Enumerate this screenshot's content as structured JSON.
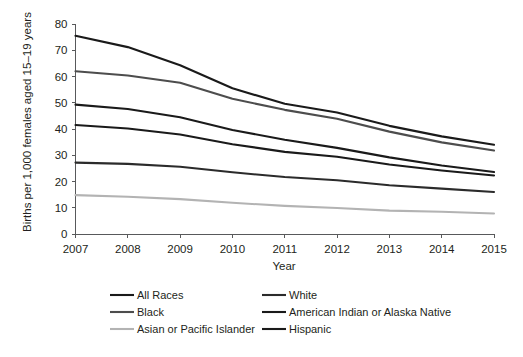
{
  "chart_data": {
    "type": "line",
    "title": "",
    "xlabel": "Year",
    "ylabel": "Births per 1,000 females aged 15–19 years",
    "x": [
      2007,
      2008,
      2009,
      2010,
      2011,
      2012,
      2013,
      2014,
      2015
    ],
    "xtick_labels": [
      "2007",
      "2008",
      "2009",
      "2010",
      "2011",
      "2012",
      "2013",
      "2014",
      "2015"
    ],
    "ytick_labels": [
      "0",
      "10",
      "20",
      "30",
      "40",
      "50",
      "60",
      "70",
      "80"
    ],
    "ytick_values": [
      0,
      10,
      20,
      30,
      40,
      50,
      60,
      70,
      80
    ],
    "xlim": [
      2007,
      2015
    ],
    "ylim": [
      0,
      80
    ],
    "grid": false,
    "legend_position": "bottom",
    "series": [
      {
        "name": "All Races",
        "color": "#1a1a1a",
        "width": 2.1,
        "values": [
          41.5,
          40.2,
          37.9,
          34.2,
          31.3,
          29.4,
          26.5,
          24.2,
          22.3
        ]
      },
      {
        "name": "White",
        "color": "#2b2b2b",
        "width": 2.1,
        "values": [
          27.2,
          26.7,
          25.6,
          23.5,
          21.7,
          20.5,
          18.6,
          17.3,
          16.0
        ]
      },
      {
        "name": "Black",
        "color": "#4d4d4d",
        "width": 2.1,
        "values": [
          62.0,
          60.4,
          57.6,
          51.5,
          47.3,
          43.9,
          39.0,
          34.9,
          31.8
        ]
      },
      {
        "name": "American Indian or Alaska Native",
        "color": "#1a1a1a",
        "width": 2.1,
        "values": [
          75.5,
          71.2,
          64.3,
          55.5,
          49.6,
          46.3,
          41.2,
          37.2,
          34.0
        ]
      },
      {
        "name": "Asian or Pacific Islander",
        "color": "#b3b3b3",
        "width": 2.1,
        "values": [
          14.8,
          14.2,
          13.3,
          11.9,
          10.7,
          9.9,
          8.9,
          8.5,
          7.8
        ]
      },
      {
        "name": "Hispanic",
        "color": "#1a1a1a",
        "width": 2.1,
        "values": [
          49.3,
          47.6,
          44.5,
          39.6,
          35.9,
          32.8,
          29.2,
          26.1,
          23.6
        ]
      }
    ]
  },
  "axes": {
    "y_title": "Births per 1,000 females aged 15–19 years",
    "x_title": "Year",
    "y_ticks": [
      "80",
      "70",
      "60",
      "50",
      "40",
      "30",
      "20",
      "10",
      "0"
    ],
    "x_ticks": [
      "2007",
      "2008",
      "2009",
      "2010",
      "2011",
      "2012",
      "2013",
      "2014",
      "2015"
    ]
  },
  "legend": {
    "entries": [
      {
        "label": "All Races",
        "color": "#1a1a1a"
      },
      {
        "label": "White",
        "color": "#2b2b2b"
      },
      {
        "label": "Black",
        "color": "#4d4d4d"
      },
      {
        "label": "American Indian or Alaska Native",
        "color": "#1a1a1a"
      },
      {
        "label": "Asian or Pacific Islander",
        "color": "#b3b3b3"
      },
      {
        "label": "Hispanic",
        "color": "#1a1a1a"
      }
    ]
  },
  "colors": {
    "axis": "#58595b",
    "text": "#231f20",
    "background": "#ffffff"
  }
}
